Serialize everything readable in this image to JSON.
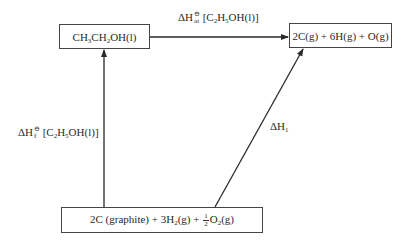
{
  "diagram": {
    "type": "Hess cycle (enthalpy diagram)",
    "nodes": {
      "ethanol": {
        "parts": [
          "CH",
          "3",
          "CH",
          "2",
          "OH(l)"
        ],
        "text": "CH3CH2OH(l)"
      },
      "atoms": {
        "text": "2C(g) + 6H(g) + O(g)"
      },
      "elements": {
        "p1": "2C (graphite) + 3H",
        "p1_sub": "2",
        "p2": "(g) + ",
        "frac_num": "1",
        "frac_den": "2",
        "p3": "O",
        "p3_sub": "2",
        "p4": "(g)",
        "text": "2C (graphite) + 3H2(g) + 1/2 O2(g)"
      }
    },
    "edges": {
      "atomisation": {
        "from": "ethanol",
        "to": "atoms",
        "delta": "ΔH",
        "sup": "⊖",
        "sub": "at",
        "species_open": " [C",
        "s1": "2",
        "mid": "H",
        "s2": "5",
        "tail": "OH(l)]",
        "text": "ΔH°at [C2H5OH(l)]"
      },
      "formation": {
        "from": "elements",
        "to": "ethanol",
        "delta": "ΔH",
        "sup": "⊖",
        "sub": "f",
        "species_open": " [C",
        "s1": "2",
        "mid": "H",
        "s2": "5",
        "tail": "OH(l)]",
        "text": "ΔH°f [C2H5OH(l)]"
      },
      "route1": {
        "from": "elements",
        "to": "atoms",
        "delta": "ΔH",
        "sub": "1",
        "text": "ΔH1"
      }
    },
    "colors": {
      "line": "#2a2a2a",
      "box_border": "#444444",
      "background": "#ffffff"
    }
  }
}
